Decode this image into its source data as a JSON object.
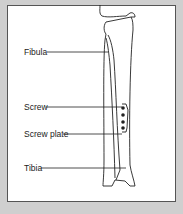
{
  "diagram": {
    "labels": {
      "fibula": "Fibula",
      "screw": "Screw",
      "screw_plate": "Screw plate",
      "tibia": "Tibia"
    },
    "colors": {
      "background": "#cfcfcf",
      "panel": "#ffffff",
      "stroke": "#222222"
    }
  }
}
